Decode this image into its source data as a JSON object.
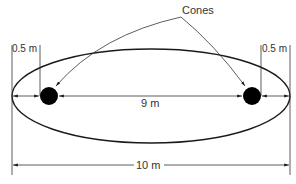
{
  "diagram": {
    "callout_label": "Cones",
    "left_offset_label": "0.5 m",
    "right_offset_label": "0.5 m",
    "inner_distance_label": "9 m",
    "total_distance_label": "10 m",
    "colors": {
      "line": "#1a1a1a",
      "cone": "#000000",
      "text": "#333333",
      "background": "#ffffff"
    }
  }
}
